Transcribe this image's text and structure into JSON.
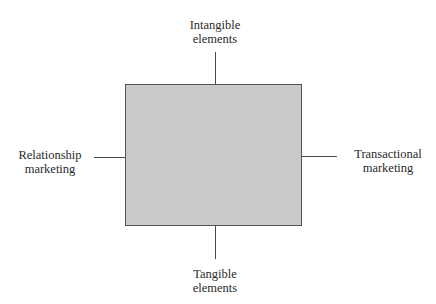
{
  "diagram": {
    "type": "two-axis positioning diagram",
    "colors": {
      "box_fill": "#cacaca",
      "box_border": "#555555",
      "axis_line": "#4a4a4a",
      "text": "#2a2a2a"
    },
    "axes": {
      "top": {
        "line1": "Intangible",
        "line2": "elements"
      },
      "bottom": {
        "line1": "Tangible",
        "line2": "elements"
      },
      "left": {
        "line1": "Relationship",
        "line2": "marketing"
      },
      "right": {
        "line1": "Transactional",
        "line2": "marketing"
      }
    }
  }
}
